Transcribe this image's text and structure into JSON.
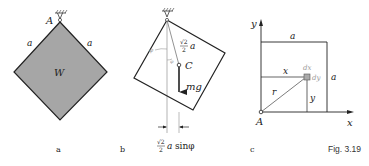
{
  "figure": {
    "caption": "Fig. 3.19",
    "panels": [
      {
        "id": "a",
        "label": "a",
        "pivot_label": "A",
        "side_left": "a",
        "side_right": "a",
        "body_label": "W",
        "fill_color": "#a6a6a6"
      },
      {
        "id": "b",
        "label": "b",
        "distance_label_num": "√2",
        "distance_label_den": "2",
        "distance_label_var": "a",
        "center_label": "C",
        "force_label": "mg",
        "angle_label": "φ",
        "angle_label_small": "φ",
        "offset_label_num": "√2",
        "offset_label_den": "2",
        "offset_label_var": "a",
        "offset_label_fn": "sinφ"
      },
      {
        "id": "c",
        "label": "c",
        "y_axis": "y",
        "x_axis": "x",
        "origin_label": "A",
        "top_side": "a",
        "right_side": "a",
        "x_dist": "x",
        "y_dist": "y",
        "radius": "r",
        "dx_label": "dx",
        "dy_label": "dy"
      }
    ]
  }
}
